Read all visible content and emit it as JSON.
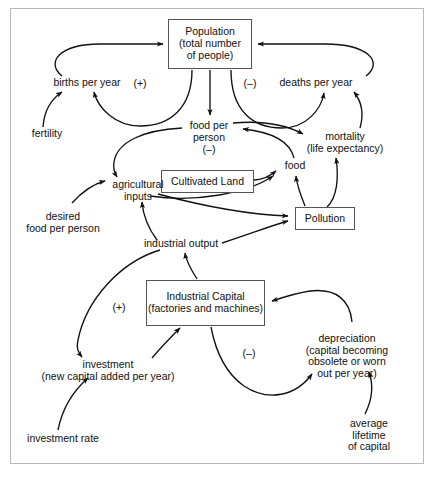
{
  "diagram": {
    "frame_color": "#b9b9b9",
    "line_color": "#111111",
    "box_border_color": "#555555",
    "background": "#ffffff"
  },
  "boxes": [
    {
      "id": "population",
      "label": "Population\n(total number\nof people)",
      "x": 168,
      "y": 19,
      "w": 84,
      "h": 50
    },
    {
      "id": "cultivated_land",
      "label": "Cultivated Land",
      "x": 161,
      "y": 170,
      "w": 93,
      "h": 23
    },
    {
      "id": "pollution",
      "label": "Pollution",
      "x": 295,
      "y": 207,
      "w": 60,
      "h": 23
    },
    {
      "id": "industrial_capital",
      "label": "Industrial Capital\n(factories and machines)",
      "x": 146,
      "y": 280,
      "w": 119,
      "h": 46
    }
  ],
  "labels": [
    {
      "id": "births_per_year",
      "text": "births per year",
      "x": 87,
      "y": 84
    },
    {
      "id": "fertility",
      "text": "fertility",
      "x": 47,
      "y": 135
    },
    {
      "id": "deaths_per_year",
      "text": "deaths per year",
      "x": 316,
      "y": 84
    },
    {
      "id": "mortality",
      "text": "mortality\n(life expectancy)",
      "x": 345,
      "y": 138
    },
    {
      "id": "food_per_person",
      "text": "food per\nperson",
      "x": 209,
      "y": 127
    },
    {
      "id": "food",
      "text": "food",
      "x": 295,
      "y": 167
    },
    {
      "id": "agricultural_inputs",
      "text": "agricultural\ninputs",
      "x": 138,
      "y": 186
    },
    {
      "id": "desired_food_per_person",
      "text": "desired\nfood per person",
      "x": 63,
      "y": 218
    },
    {
      "id": "industrial_output",
      "text": "industrial output",
      "x": 181,
      "y": 245
    },
    {
      "id": "investment",
      "text": "investment\n(new capital added per year)",
      "x": 108,
      "y": 366
    },
    {
      "id": "investment_rate",
      "text": "investment rate",
      "x": 63,
      "y": 440
    },
    {
      "id": "depreciation",
      "text": "depreciation\n(capital becoming\nobsolete or worn out per year)",
      "x": 347,
      "y": 340
    },
    {
      "id": "average_lifetime_of_capital",
      "text": "average lifetime\nof capital",
      "x": 369,
      "y": 425
    }
  ],
  "signs": [
    {
      "id": "sign-births-positive",
      "text": "(+)",
      "x": 140,
      "y": 84,
      "meaning": "positive-feedback"
    },
    {
      "id": "sign-deaths-negative",
      "text": "(–)",
      "x": 250,
      "y": 84,
      "meaning": "negative-feedback"
    },
    {
      "id": "sign-food-per-person-negative",
      "text": "(–)",
      "x": 209,
      "y": 150,
      "meaning": "negative-feedback"
    },
    {
      "id": "sign-capital-positive",
      "text": "(+)",
      "x": 119,
      "y": 308,
      "meaning": "positive-feedback"
    },
    {
      "id": "sign-depreciation-negative",
      "text": "(–)",
      "x": 249,
      "y": 354,
      "meaning": "negative-feedback"
    }
  ],
  "edges": [
    {
      "id": "births-to-population",
      "from": "births per year",
      "to": "Population"
    },
    {
      "id": "population-to-births",
      "from": "Population",
      "to": "births per year"
    },
    {
      "id": "fertility-to-births",
      "from": "fertility",
      "to": "births per year"
    },
    {
      "id": "population-to-deaths",
      "from": "Population",
      "to": "deaths per year"
    },
    {
      "id": "deaths-to-population",
      "from": "deaths per year",
      "to": "Population"
    },
    {
      "id": "mortality-to-deaths",
      "from": "mortality",
      "to": "deaths per year"
    },
    {
      "id": "population-to-food-per-person",
      "from": "Population",
      "to": "food per person"
    },
    {
      "id": "food-to-food-per-person",
      "from": "food",
      "to": "food per person"
    },
    {
      "id": "food-per-person-to-mortality",
      "from": "food per person",
      "to": "mortality"
    },
    {
      "id": "food-per-person-to-agricultural-inputs",
      "from": "food per person",
      "to": "agricultural inputs"
    },
    {
      "id": "desired-food-to-agricultural-inputs",
      "from": "desired food per person",
      "to": "agricultural inputs"
    },
    {
      "id": "agricultural-inputs-to-food",
      "from": "agricultural inputs",
      "to": "food"
    },
    {
      "id": "cultivated-land-to-food",
      "from": "Cultivated Land",
      "to": "food"
    },
    {
      "id": "pollution-to-food",
      "from": "Pollution",
      "to": "food"
    },
    {
      "id": "pollution-to-mortality",
      "from": "Pollution",
      "to": "mortality"
    },
    {
      "id": "agricultural-inputs-to-pollution",
      "from": "agricultural inputs",
      "to": "Pollution"
    },
    {
      "id": "industrial-output-to-pollution",
      "from": "industrial output",
      "to": "Pollution"
    },
    {
      "id": "industrial-output-to-agricultural-inputs",
      "from": "industrial output",
      "to": "agricultural inputs"
    },
    {
      "id": "industrial-capital-to-industrial-output",
      "from": "Industrial Capital",
      "to": "industrial output"
    },
    {
      "id": "industrial-output-to-investment",
      "from": "industrial output",
      "to": "investment"
    },
    {
      "id": "investment-rate-to-investment",
      "from": "investment rate",
      "to": "investment"
    },
    {
      "id": "investment-to-industrial-capital",
      "from": "investment",
      "to": "Industrial Capital"
    },
    {
      "id": "industrial-capital-to-depreciation",
      "from": "Industrial Capital",
      "to": "depreciation"
    },
    {
      "id": "depreciation-to-industrial-capital",
      "from": "depreciation",
      "to": "Industrial Capital"
    },
    {
      "id": "average-lifetime-to-depreciation",
      "from": "average lifetime of capital",
      "to": "depreciation"
    }
  ]
}
